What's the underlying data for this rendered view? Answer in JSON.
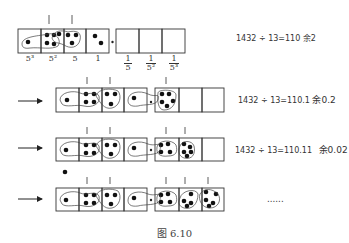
{
  "figure": {
    "caption": "图 6.10",
    "rows": [
      {
        "equation": "1432 ÷ 13=110 余2",
        "equation_parts": {
          "expr": "1432 ÷ 13=110 ",
          "rem_word": "余",
          "rem_value": "2"
        },
        "place_labels": [
          "5³",
          "5²",
          "5",
          "1"
        ],
        "fraction_labels": [
          {
            "num": "1",
            "den": "5"
          },
          {
            "num": "1",
            "den": "5²"
          },
          {
            "num": "1",
            "den": "5³"
          }
        ]
      },
      {
        "equation": "1432 ÷ 13=110.1 余0.2",
        "equation_parts": {
          "expr": "1432 ÷ 13=110.1 ",
          "rem_word": "余",
          "rem_value": "0.2"
        }
      },
      {
        "equation": "1432 ÷ 13=110.11 余0.02",
        "equation_parts": {
          "expr": "1432 ÷ 13=110.11 ",
          "rem_word": "余",
          "rem_value": "0.02"
        }
      },
      {
        "equation": "……",
        "equation_parts": {
          "expr": "......",
          "rem_word": "",
          "rem_value": ""
        }
      }
    ],
    "icons": [
      "arrow-right-icon",
      "dot-icon",
      "loop-group-icon"
    ]
  }
}
